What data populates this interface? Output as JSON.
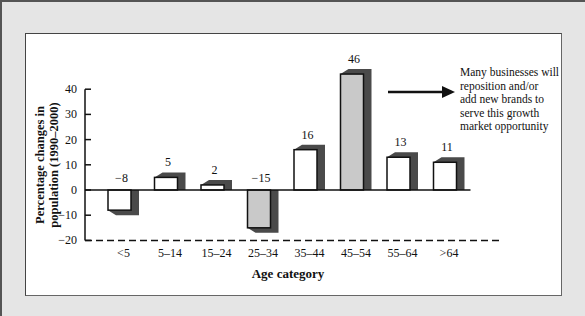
{
  "chart_data": {
    "type": "bar",
    "title": "",
    "xlabel": "Age category",
    "ylabel_lines": [
      "Percentage changes in",
      "population (1990–2000)"
    ],
    "ylabel": "Percentage changes in population (1990–2000)",
    "categories": [
      "<5",
      "5–14",
      "15–24",
      "25–34",
      "35–44",
      "45–54",
      "55–64",
      ">64"
    ],
    "values": [
      -8,
      5,
      2,
      -15,
      16,
      46,
      13,
      11
    ],
    "value_labels": [
      "−8",
      "5",
      "2",
      "−15",
      "16",
      "46",
      "13",
      "11"
    ],
    "highlighted": [
      false,
      false,
      false,
      true,
      false,
      true,
      false,
      false
    ],
    "yticks": [
      40,
      30,
      20,
      10,
      0,
      -10,
      -20
    ],
    "ytick_labels": [
      "40",
      "30",
      "20",
      "10",
      "0",
      "−10",
      "−20"
    ],
    "ylim": [
      -20,
      46
    ],
    "grid": false,
    "legend": null,
    "baseline_style": "dashed line at -20",
    "annotation": {
      "text_lines": [
        "Many businesses will",
        "reposition and/or",
        "add new brands to",
        "serve this growth",
        "market opportunity"
      ],
      "arrow_points_to": "annotation text, from right of 45–54 bar"
    },
    "colors": {
      "bar_fill": "#ffffff",
      "bar_highlight_fill": "#c9c9c9",
      "bar_shadow": "#4a4a4a",
      "background_frame": "#e5e5e5",
      "panel": "#ffffff"
    }
  }
}
